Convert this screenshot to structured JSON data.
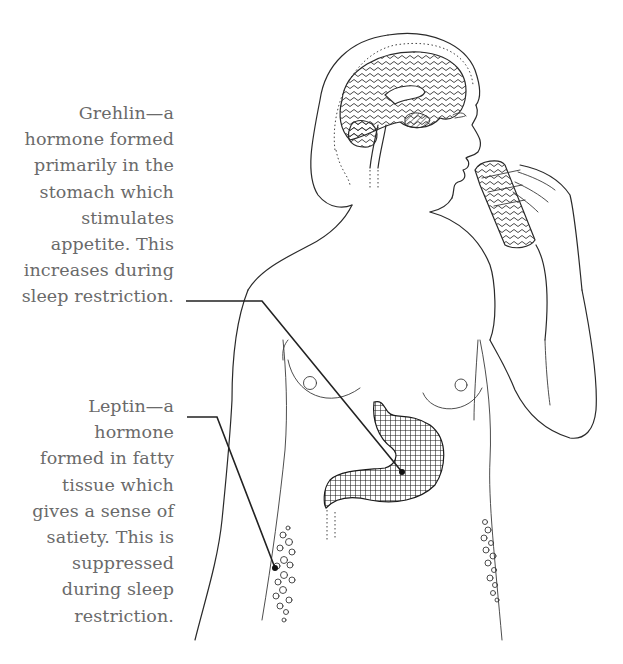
{
  "figure": {
    "type": "anatomical-illustration",
    "colors": {
      "text": "#6a6a6a",
      "ink": "#2a2a2a",
      "background": "#ffffff"
    }
  },
  "labels": {
    "ghrelin": {
      "lines": [
        "Grehlin—a",
        "hormone formed",
        "primarily in the",
        "stomach which",
        "stimulates",
        "appetite. This",
        "increases during",
        "sleep restriction."
      ],
      "points_to": "stomach"
    },
    "leptin": {
      "lines": [
        "Leptin—a",
        "hormone",
        "formed in fatty",
        "tissue which",
        "gives a sense of",
        "satiety. This is",
        "suppressed",
        "during sleep",
        "restriction."
      ],
      "points_to": "fatty-tissue"
    }
  }
}
